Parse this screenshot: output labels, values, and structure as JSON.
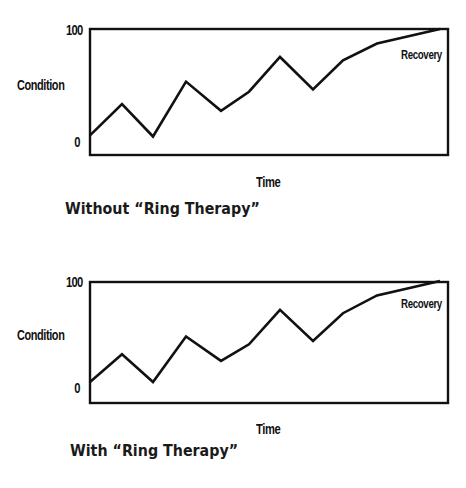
{
  "chart_data": [
    {
      "type": "line",
      "title": "Without “Ring Therapy”",
      "caption": "Without “Ring Therapy”",
      "xlabel": "Time",
      "ylabel": "Condition",
      "ylim": [
        0,
        100
      ],
      "yticks": [
        "0",
        "100"
      ],
      "xticks": [],
      "grid": false,
      "legend": null,
      "annotations": [
        {
          "text": "Recovery",
          "x": 10,
          "y": 87
        }
      ],
      "series": [
        {
          "name": "Condition",
          "x": [
            0,
            1,
            2,
            3,
            4,
            5,
            6,
            7,
            8,
            9,
            10
          ],
          "values": [
            5,
            33,
            4,
            53,
            27,
            44,
            75,
            46,
            72,
            87,
            100
          ]
        }
      ]
    },
    {
      "type": "line",
      "title": "With “Ring Therapy”",
      "caption": "With “Ring Therapy”",
      "xlabel": "Time",
      "ylabel": "Condition",
      "ylim": [
        0,
        100
      ],
      "yticks": [
        "0",
        "100"
      ],
      "xticks": [],
      "grid": false,
      "legend": null,
      "annotations": [
        {
          "text": "Recovery",
          "x": 10,
          "y": 87
        }
      ],
      "series": [
        {
          "name": "Condition",
          "x": [
            0,
            1,
            2,
            3,
            4,
            5,
            6,
            7,
            8,
            9,
            10
          ],
          "values": [
            9,
            34,
            9,
            50,
            28,
            43,
            74,
            46,
            71,
            87,
            100
          ]
        }
      ]
    }
  ],
  "colors": {
    "line": "#111111",
    "axis": "#111111",
    "background": "#ffffff"
  }
}
